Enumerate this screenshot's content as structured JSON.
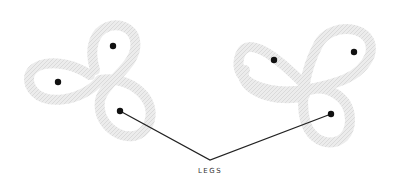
{
  "diagram": {
    "label": "LEGS",
    "colors": {
      "rope": "#e9e9e9",
      "rope_edge": "#d8d8d8",
      "dot": "#111111",
      "line": "#222222",
      "background": "#ffffff"
    },
    "knots": [
      {
        "name": "three-loop-knot-left",
        "dots": [
          [
            113,
            46
          ],
          [
            58,
            82
          ],
          [
            120,
            111
          ]
        ],
        "leg_dot_index": 2
      },
      {
        "name": "three-loop-knot-right",
        "dots": [
          [
            274,
            60
          ],
          [
            354,
            52
          ],
          [
            331,
            114
          ]
        ],
        "leg_dot_index": 2
      }
    ],
    "leader_apex": [
      210,
      160
    ]
  }
}
